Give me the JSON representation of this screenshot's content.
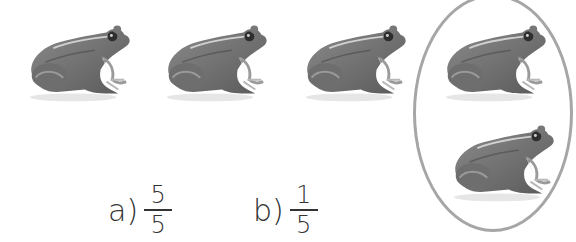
{
  "figure": {
    "frogs_total": 5,
    "frogs_circled": 2,
    "frog_icon": "frog-image"
  },
  "options": [
    {
      "label": "a)",
      "numerator": "5",
      "denominator": "5"
    },
    {
      "label": "b)",
      "numerator": "1",
      "denominator": "5"
    }
  ],
  "colors": {
    "ellipse": "#a6a6a6",
    "text": "#333333"
  }
}
